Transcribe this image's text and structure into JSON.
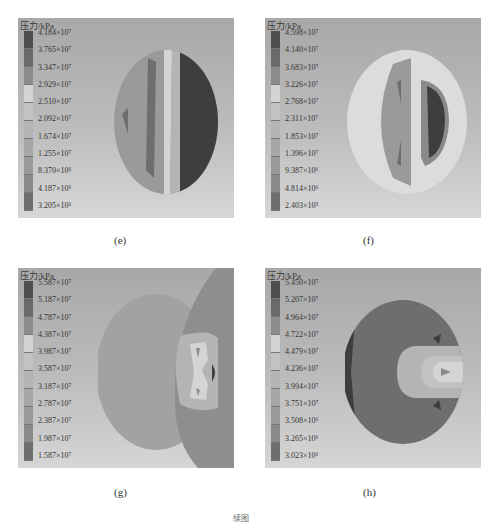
{
  "legend_title": "压力/kPa",
  "panels": {
    "e": {
      "caption": "(e)",
      "legend": [
        "4.184×10⁷",
        "3.765×10⁷",
        "3.347×10⁷",
        "2.929×10⁷",
        "2.510×10⁷",
        "2.092×10⁷",
        "1.674×10⁷",
        "1.255×10⁷",
        "8.370×10⁶",
        "4.187×10⁶",
        "3.205×10³"
      ]
    },
    "f": {
      "caption": "(f)",
      "legend": [
        "4.598×10⁷",
        "4.140×10⁷",
        "3.683×10⁷",
        "3.226×10⁷",
        "2.768×10⁷",
        "2.311×10⁷",
        "1.853×10⁷",
        "1.396×10⁷",
        "9.387×10⁶",
        "4.814×10⁶",
        "2.403×10⁵"
      ]
    },
    "g": {
      "caption": "(g)",
      "legend": [
        "5.587×10⁷",
        "5.187×10⁷",
        "4.787×10⁷",
        "4.387×10⁷",
        "3.987×10⁷",
        "3.587×10⁷",
        "3.187×10⁷",
        "2.787×10⁷",
        "2.387×10⁷",
        "1.987×10⁷",
        "1.587×10⁷"
      ]
    },
    "h": {
      "caption": "(h)",
      "legend": [
        "5.450×10⁷",
        "5.207×10⁷",
        "4.964×10⁷",
        "4.722×10⁷",
        "4.479×10⁷",
        "4.236×10⁷",
        "3.994×10⁷",
        "3.751×10⁷",
        "3.508×10⁶",
        "3.265×10⁶",
        "3.023×10⁶"
      ]
    }
  },
  "legend_colors": [
    "#4e4e4e",
    "#6a6a6a",
    "#8c8c8c",
    "#d4d4d4",
    "#c2c2c2",
    "#b4b4b4",
    "#a6a6a6",
    "#9a9a9a",
    "#8a8a8a",
    "#6e6e6e",
    "#3e3e3e"
  ],
  "figure_caption": "续图"
}
